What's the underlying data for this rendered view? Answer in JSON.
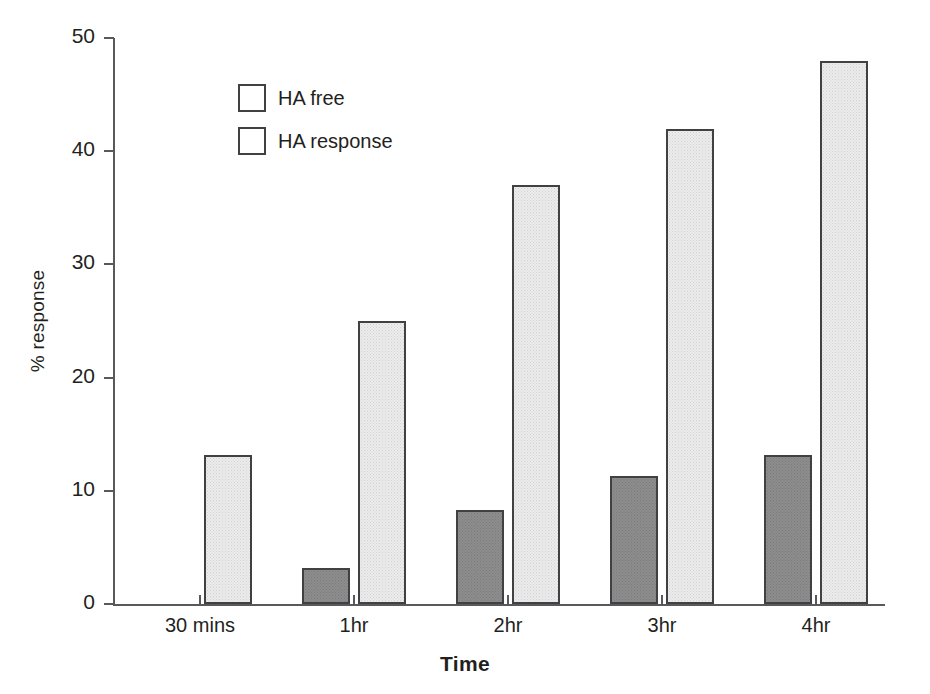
{
  "chart_data": {
    "type": "bar",
    "title": "",
    "xlabel": "Time",
    "ylabel": "% response",
    "categories": [
      "30 mins",
      "1hr",
      "2hr",
      "3hr",
      "4hr"
    ],
    "series": [
      {
        "name": "HA free",
        "color": "#8d8d8d",
        "values": [
          0,
          3.2,
          8.3,
          11.3,
          13.2
        ]
      },
      {
        "name": "HA response",
        "color": "#ececec",
        "values": [
          13.2,
          25,
          37,
          42,
          48
        ]
      }
    ],
    "ylim": [
      0,
      50
    ],
    "yticks": [
      0,
      10,
      20,
      30,
      40,
      50
    ],
    "ytick_labels": [
      "0",
      "10",
      "20",
      "30",
      "40",
      "50"
    ],
    "grid": false,
    "legend_position": "top-left-inside"
  },
  "legend": {
    "entries": [
      {
        "label": "HA free"
      },
      {
        "label": "HA response"
      }
    ]
  },
  "axes": {
    "y_title": "% response",
    "x_title": "Time"
  }
}
